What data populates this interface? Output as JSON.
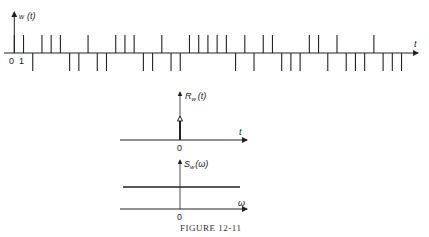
{
  "figure": {
    "caption": "FIGURE 12-11"
  },
  "chart_data": [
    {
      "type": "line",
      "title": "w(t)",
      "ylabel": "w(t)",
      "xlabel": "t",
      "description": "Random binary impulse train: unit impulses at integer times with random sign (+1 up, -1 down)",
      "x_tick_labels": [
        "0",
        "1"
      ],
      "x": [
        0,
        1,
        2,
        3,
        4,
        5,
        6,
        7,
        8,
        9,
        10,
        11,
        12,
        13,
        14,
        15,
        16,
        17,
        18,
        19,
        20,
        21,
        22,
        23,
        24,
        25,
        26,
        27,
        28,
        29,
        30,
        31,
        32,
        33,
        34,
        35,
        36,
        37,
        38,
        39,
        40,
        41,
        42
      ],
      "values": [
        1,
        1,
        -1,
        1,
        1,
        1,
        -1,
        -1,
        1,
        -1,
        -1,
        1,
        1,
        1,
        -1,
        -1,
        1,
        -1,
        -1,
        1,
        1,
        1,
        1,
        1,
        -1,
        1,
        -1,
        1,
        1,
        -1,
        -1,
        -1,
        1,
        1,
        -1,
        1,
        -1,
        -1,
        -1,
        1,
        -1,
        -1,
        -1
      ]
    },
    {
      "type": "line",
      "title": "R_w(t)",
      "ylabel": "R_w(t)",
      "xlabel": "t",
      "x_tick_labels": [
        "0"
      ],
      "description": "Autocorrelation: single impulse at t = 0",
      "impulses": [
        {
          "x": 0,
          "value": 1
        }
      ]
    },
    {
      "type": "line",
      "title": "S_w(ω)",
      "ylabel": "S_w(ω)",
      "xlabel": "ω",
      "x_tick_labels": [
        "0"
      ],
      "description": "Power spectrum: constant (flat) for all ω",
      "x": [
        -1,
        1
      ],
      "values": [
        1,
        1
      ]
    }
  ],
  "labels": {
    "top_y": "w",
    "top_y_arg": "(t)",
    "top_x": "t",
    "top_origin": "0",
    "top_one": "1",
    "mid_y": "R",
    "mid_y_sub": "w",
    "mid_y_arg": "(t)",
    "mid_x": "t",
    "mid_origin": "0",
    "bot_y": "S",
    "bot_y_sub": "w",
    "bot_y_arg": "(ω)",
    "bot_x": "ω",
    "bot_origin": "0"
  }
}
